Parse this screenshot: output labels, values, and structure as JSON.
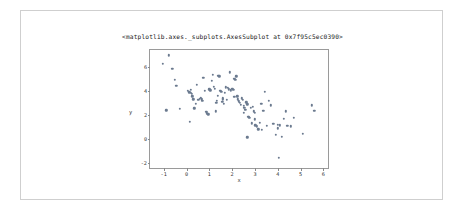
{
  "figure": {
    "title": "<matplotlib.axes._subplots.AxesSubplot at 0x7f95c5ec0390>",
    "background_color": "#ffffff",
    "border_color": "#cfcfcf"
  },
  "chart_data": {
    "type": "scatter",
    "title": "<matplotlib.axes._subplots.AxesSubplot at 0x7f95c5ec0390>",
    "xlabel": "x",
    "ylabel": "y",
    "xlim": [
      -1.6,
      6.2
    ],
    "ylim": [
      -2.4,
      7.4
    ],
    "xticks": [
      -1,
      0,
      1,
      2,
      3,
      4,
      5,
      6
    ],
    "xticklabels": [
      "-1",
      "0",
      "1",
      "2",
      "3",
      "4",
      "5",
      "6"
    ],
    "yticks": [
      -2,
      0,
      2,
      4,
      6
    ],
    "yticklabels": [
      "-2",
      "0",
      "2",
      "4",
      "6"
    ],
    "grid": false,
    "legend": null,
    "marker_color": "#6b7a8f",
    "marker_size": 2.4,
    "series": [
      {
        "name": "points",
        "x": [
          -1.05,
          -0.78,
          -0.62,
          -0.52,
          -0.44,
          -0.88,
          -0.3,
          0.06,
          0.12,
          0.18,
          0.15,
          0.22,
          0.26,
          0.3,
          0.34,
          0.4,
          0.46,
          0.52,
          0.58,
          0.62,
          0.66,
          0.7,
          0.74,
          0.8,
          0.86,
          0.9,
          0.95,
          1.0,
          1.05,
          1.1,
          1.15,
          1.2,
          1.25,
          1.28,
          1.32,
          1.36,
          1.4,
          1.44,
          1.48,
          1.52,
          1.56,
          1.6,
          1.64,
          1.68,
          1.72,
          1.76,
          1.8,
          1.85,
          1.9,
          1.95,
          2.0,
          2.05,
          2.1,
          2.14,
          2.18,
          2.22,
          2.26,
          2.3,
          2.34,
          2.38,
          2.42,
          2.46,
          2.5,
          2.54,
          2.58,
          2.62,
          2.66,
          2.7,
          2.74,
          2.78,
          2.82,
          2.86,
          2.9,
          2.94,
          2.98,
          3.02,
          3.08,
          3.14,
          3.2,
          3.28,
          3.36,
          3.44,
          3.52,
          3.6,
          3.7,
          3.8,
          3.9,
          4.0,
          4.05,
          4.1,
          4.18,
          4.26,
          4.34,
          4.42,
          4.58,
          4.7,
          5.1,
          5.5,
          5.6,
          2.66,
          1.3,
          2.1,
          3.0,
          4.0,
          0.2,
          1.6,
          2.5,
          3.3
        ],
        "y": [
          6.25,
          6.95,
          5.85,
          4.95,
          4.45,
          2.4,
          2.5,
          4.0,
          3.9,
          3.85,
          1.45,
          3.75,
          3.55,
          3.3,
          2.55,
          2.95,
          4.5,
          3.25,
          3.35,
          3.45,
          3.3,
          3.2,
          5.1,
          4.0,
          2.25,
          2.15,
          2.05,
          4.15,
          4.05,
          4.85,
          5.35,
          4.35,
          4.2,
          2.3,
          3.2,
          3.6,
          5.25,
          5.2,
          4.0,
          3.95,
          3.1,
          3.3,
          2.95,
          3.85,
          4.3,
          3.25,
          4.25,
          4.15,
          5.55,
          4.05,
          4.2,
          4.1,
          5.0,
          4.95,
          5.2,
          3.55,
          3.3,
          3.15,
          3.0,
          2.85,
          3.4,
          3.25,
          2.75,
          2.6,
          2.45,
          3.05,
          2.9,
          1.85,
          1.8,
          1.75,
          2.6,
          1.3,
          2.7,
          2.3,
          2.2,
          1.15,
          1.05,
          0.8,
          1.35,
          2.95,
          2.35,
          3.95,
          1.1,
          3.2,
          2.8,
          1.25,
          0.35,
          1.2,
          -1.55,
          1.15,
          0.2,
          1.7,
          2.3,
          1.1,
          1.05,
          1.75,
          0.45,
          2.8,
          2.35,
          0.15,
          3.0,
          3.5,
          1.65,
          0.9,
          4.1,
          3.4,
          2.2,
          0.75
        ]
      }
    ]
  }
}
